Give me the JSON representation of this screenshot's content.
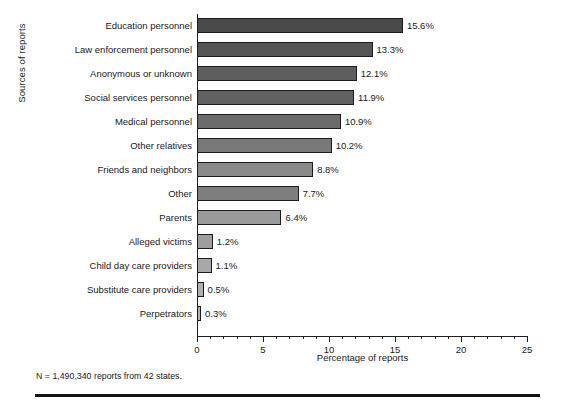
{
  "chart_data": {
    "type": "bar",
    "orientation": "horizontal",
    "title": "",
    "xlabel": "Percentage of reports",
    "ylabel": "Sources of reports",
    "xlim": [
      0,
      25
    ],
    "xticks": [
      0,
      5,
      10,
      15,
      20,
      25
    ],
    "xtick_labels": [
      "0",
      "5",
      "10",
      "15",
      "20",
      "25"
    ],
    "minor_tick_interval": 1,
    "grid": false,
    "legend": null,
    "value_label_suffix": "%",
    "categories": [
      "Education personnel",
      "Law enforcement personnel",
      "Anonymous or unknown",
      "Social services personnel",
      "Medical personnel",
      "Other relatives",
      "Friends and neighbors",
      "Other",
      "Parents",
      "Alleged victims",
      "Child day care providers",
      "Substitute care providers",
      "Perpetrators"
    ],
    "values": [
      15.6,
      13.3,
      12.1,
      11.9,
      10.9,
      10.2,
      8.8,
      7.7,
      6.4,
      1.2,
      1.1,
      0.5,
      0.3
    ],
    "value_labels": [
      "15.6%",
      "13.3%",
      "12.1%",
      "11.9%",
      "10.9%",
      "10.2%",
      "8.8%",
      "7.7%",
      "6.4%",
      "1.2%",
      "1.1%",
      "0.5%",
      "0.3%"
    ],
    "bar_colors": [
      "#4a4a4a",
      "#555555",
      "#5e5e5e",
      "#616161",
      "#6b6b6b",
      "#787878",
      "#8a8a8a",
      "#7e7e7e",
      "#9a9a9a",
      "#9e9e9e",
      "#a8a8a8",
      "#b0b0b0",
      "#b5b5b5"
    ],
    "bar_edge_color": "#1c1c1c",
    "axis_color": "#1f1f1f",
    "background": "#ffffff",
    "footnote": "N = 1,490,340 reports from 42 states."
  }
}
